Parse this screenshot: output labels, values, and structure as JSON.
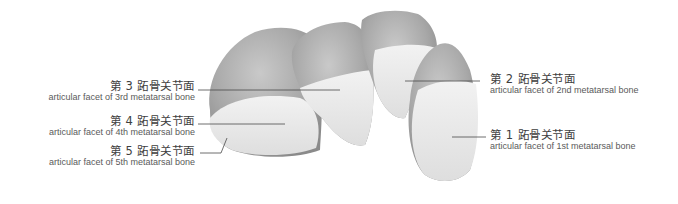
{
  "figure": {
    "labels": [
      {
        "id": "facet-3",
        "zh": "第 3 跖骨关节面",
        "en": "articular facet of 3rd metatarsal bone",
        "side": "left"
      },
      {
        "id": "facet-4",
        "zh": "第 4 跖骨关节面",
        "en": "articular facet of 4th metatarsal bone",
        "side": "left"
      },
      {
        "id": "facet-5",
        "zh": "第 5 跖骨关节面",
        "en": "articular facet of 5th metatarsal bone",
        "side": "left"
      },
      {
        "id": "facet-2",
        "zh": "第 2 跖骨关节面",
        "en": "articular facet of 2nd metatarsal bone",
        "side": "right"
      },
      {
        "id": "facet-1",
        "zh": "第 1 跖骨关节面",
        "en": "articular facet of 1st metatarsal bone",
        "side": "right"
      }
    ],
    "colors": {
      "bone_shadow": "#8f8f8f",
      "bone_mid": "#bdbdbd",
      "facet_light": "#ececec",
      "leader_line": "#4a4a4a",
      "text": "#4a4a4a"
    }
  }
}
